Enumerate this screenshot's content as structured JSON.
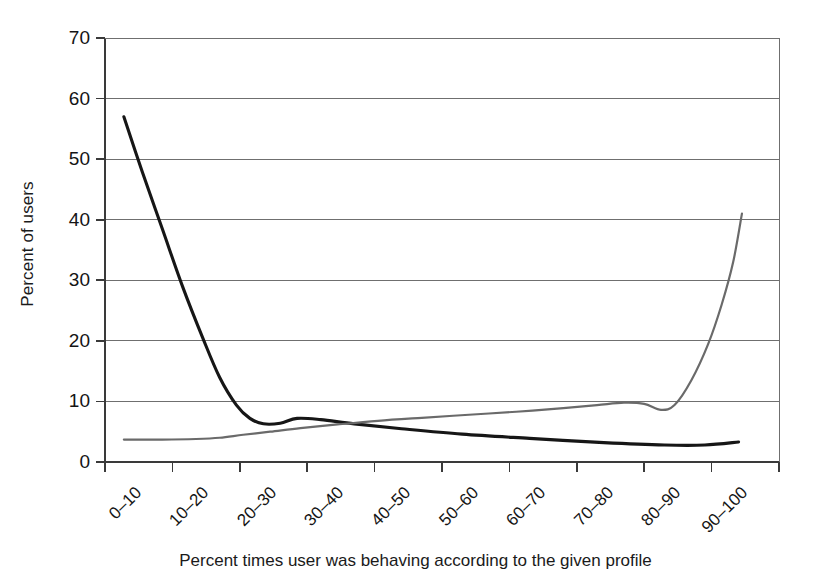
{
  "chart_data": {
    "type": "line",
    "title": "",
    "xlabel": "Percent times user was behaving according to the given profile",
    "ylabel": "Percent of users",
    "categories": [
      "0–10",
      "10–20",
      "20–30",
      "30–40",
      "40–50",
      "50–60",
      "60–70",
      "70–80",
      "80–90",
      "90–100"
    ],
    "ylim": [
      0,
      70
    ],
    "yticks": [
      0,
      10,
      20,
      30,
      40,
      50,
      60,
      70
    ],
    "ytick_labels": [
      "0",
      "10",
      "20",
      "30",
      "40",
      "50",
      "60",
      "70"
    ],
    "grid": "horizontal",
    "legend": "none",
    "series": [
      {
        "name": "declining-curve",
        "color": "#161616",
        "width": 3.1,
        "values": [
          57.0,
          12.0,
          7.0,
          5.6,
          4.9,
          4.3,
          3.7,
          3.1,
          2.8,
          3.3
        ],
        "points": [
          [
            0.28,
            57.0
          ],
          [
            0.55,
            48.0
          ],
          [
            0.85,
            38.5
          ],
          [
            1.15,
            29.0
          ],
          [
            1.45,
            20.5
          ],
          [
            1.7,
            14.0
          ],
          [
            1.95,
            9.4
          ],
          [
            2.15,
            7.2
          ],
          [
            2.35,
            6.3
          ],
          [
            2.6,
            6.4
          ],
          [
            2.85,
            7.2
          ],
          [
            3.2,
            7.0
          ],
          [
            3.7,
            6.3
          ],
          [
            4.4,
            5.5
          ],
          [
            5.3,
            4.6
          ],
          [
            6.3,
            3.9
          ],
          [
            7.4,
            3.2
          ],
          [
            8.3,
            2.8
          ],
          [
            8.9,
            2.8
          ],
          [
            9.4,
            3.3
          ]
        ]
      },
      {
        "name": "rising-curve",
        "color": "#6a6a6a",
        "width": 2.2,
        "values": [
          3.7,
          3.8,
          4.6,
          5.6,
          6.6,
          7.5,
          8.4,
          9.7,
          8.6,
          41.0
        ],
        "points": [
          [
            0.28,
            3.7
          ],
          [
            0.85,
            3.7
          ],
          [
            1.35,
            3.8
          ],
          [
            1.7,
            4.0
          ],
          [
            2.05,
            4.5
          ],
          [
            2.45,
            5.0
          ],
          [
            2.9,
            5.6
          ],
          [
            3.45,
            6.2
          ],
          [
            4.05,
            6.8
          ],
          [
            4.7,
            7.3
          ],
          [
            5.4,
            7.8
          ],
          [
            6.1,
            8.3
          ],
          [
            6.8,
            8.9
          ],
          [
            7.3,
            9.4
          ],
          [
            7.7,
            9.8
          ],
          [
            8.0,
            9.6
          ],
          [
            8.25,
            8.6
          ],
          [
            8.45,
            9.4
          ],
          [
            8.7,
            13.5
          ],
          [
            8.95,
            19.5
          ],
          [
            9.15,
            26.0
          ],
          [
            9.32,
            33.0
          ],
          [
            9.45,
            41.0
          ]
        ]
      }
    ]
  },
  "axes": {
    "y_title": "Percent of users",
    "x_title": "Percent times user was behaving according to the given profile"
  }
}
